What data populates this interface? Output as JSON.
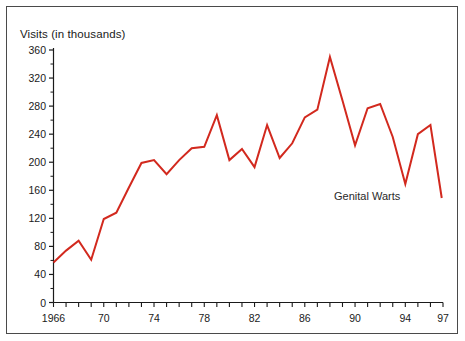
{
  "figure": {
    "background_color": "#ffffff",
    "frame_color": "#4a4a4a",
    "axis_color": "#1a1a1a",
    "line_color": "#d2291e",
    "text_color": "#1a1a1a"
  },
  "chart_data": {
    "type": "line",
    "title": "",
    "subtitle": "",
    "xlabel": "",
    "ylabel": "Visits (in thousands)",
    "ylim": [
      0,
      360
    ],
    "xlim": [
      1966,
      1997
    ],
    "grid": false,
    "legend_position": "inline-annotation",
    "y_ticks": [
      0,
      40,
      80,
      120,
      160,
      200,
      240,
      280,
      320,
      360
    ],
    "y_tick_labels": [
      "0",
      "40",
      "80",
      "120",
      "160",
      "200",
      "240",
      "280",
      "320",
      "360"
    ],
    "y_minor_tick_step": 20,
    "x_ticks": [
      1966,
      1967,
      1968,
      1969,
      1970,
      1971,
      1972,
      1973,
      1974,
      1975,
      1976,
      1977,
      1978,
      1979,
      1980,
      1981,
      1982,
      1983,
      1984,
      1985,
      1986,
      1987,
      1988,
      1989,
      1990,
      1991,
      1992,
      1993,
      1994,
      1995,
      1996,
      1997
    ],
    "x_tick_labels": [
      {
        "value": 1966,
        "label": "1966"
      },
      {
        "value": 1970,
        "label": "70"
      },
      {
        "value": 1974,
        "label": "74"
      },
      {
        "value": 1978,
        "label": "78"
      },
      {
        "value": 1982,
        "label": "82"
      },
      {
        "value": 1986,
        "label": "86"
      },
      {
        "value": 1990,
        "label": "90"
      },
      {
        "value": 1994,
        "label": "94"
      },
      {
        "value": 1997,
        "label": "97"
      }
    ],
    "annotations": [
      {
        "text": "Genital Warts",
        "x": 1992,
        "y": 155
      }
    ],
    "series": [
      {
        "name": "Genital Warts",
        "color": "#d2291e",
        "x": [
          1966,
          1967,
          1968,
          1969,
          1970,
          1971,
          1972,
          1973,
          1974,
          1975,
          1976,
          1977,
          1978,
          1979,
          1980,
          1981,
          1982,
          1983,
          1984,
          1985,
          1986,
          1987,
          1988,
          1989,
          1990,
          1991,
          1992,
          1993,
          1994,
          1995,
          1996
        ],
        "values": [
          57,
          74,
          88,
          61,
          119,
          128,
          164,
          199,
          203,
          183,
          203,
          220,
          222,
          267,
          203,
          219,
          193,
          253,
          206,
          227,
          264,
          275,
          350,
          288,
          224,
          277,
          283,
          236,
          169,
          240,
          253
        ],
        "end_point": {
          "x": 1996.9,
          "y": 149
        }
      }
    ]
  },
  "axis": {
    "ylabel_text": "Visits (in thousands)",
    "annotation_text": "Genital Warts"
  }
}
